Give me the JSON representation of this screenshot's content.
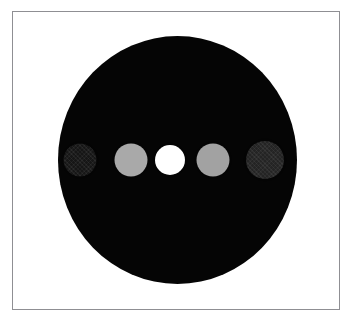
{
  "figure": {
    "canvas": {
      "width": 353,
      "height": 325,
      "background_color": "#ffffff"
    },
    "frame": {
      "label": "plot-frame",
      "border_color": "#8f8f93",
      "border_width": 1,
      "left": 12,
      "top": 11,
      "width": 328,
      "height": 299,
      "fill_color": "#ffffff"
    },
    "main_disc": {
      "label": "large-dark-disc",
      "fill_color": "#050505",
      "center_x": 177,
      "center_y": 160,
      "width": 239,
      "height": 248
    },
    "spots": [
      {
        "index": 1,
        "label": "spot-1-darkest",
        "fill_color": "#161616",
        "center_x": 80,
        "center_y": 160,
        "diameter": 33,
        "textured": true,
        "brightness_level": "darkest"
      },
      {
        "index": 2,
        "label": "spot-2-light-gray",
        "fill_color": "#a9a9a9",
        "center_x": 131,
        "center_y": 160,
        "diameter": 33,
        "textured": false,
        "brightness_level": "light"
      },
      {
        "index": 3,
        "label": "spot-3-white",
        "fill_color": "#ffffff",
        "center_x": 170,
        "center_y": 160,
        "diameter": 30,
        "textured": false,
        "brightness_level": "brightest"
      },
      {
        "index": 4,
        "label": "spot-4-light-gray",
        "fill_color": "#a2a2a2",
        "center_x": 213,
        "center_y": 160,
        "diameter": 33,
        "textured": false,
        "brightness_level": "light"
      },
      {
        "index": 5,
        "label": "spot-5-dark",
        "fill_color": "#242424",
        "center_x": 265,
        "center_y": 160,
        "diameter": 38,
        "textured": true,
        "brightness_level": "dark"
      }
    ]
  },
  "chart_data": {
    "type": "scatter",
    "title": "",
    "subtitle": "",
    "xlabel": "",
    "ylabel": "",
    "grid": false,
    "legend": null,
    "axis_ticks": [],
    "annotations": [],
    "xlim": [
      12,
      340
    ],
    "ylim": [
      11,
      310
    ],
    "background_shape": {
      "type": "ellipse",
      "center": [
        177,
        160
      ],
      "width": 239,
      "height": 248,
      "color": "#050505"
    },
    "series": [
      {
        "name": "spots",
        "marker": "circle",
        "x": [
          80,
          131,
          170,
          213,
          265
        ],
        "y": [
          160,
          160,
          160,
          160,
          160
        ],
        "sizes": [
          33,
          33,
          30,
          33,
          38
        ],
        "colors": [
          "#161616",
          "#a9a9a9",
          "#ffffff",
          "#a2a2a2",
          "#242424"
        ],
        "intensity": [
          0.09,
          0.66,
          1.0,
          0.64,
          0.14
        ]
      }
    ]
  }
}
